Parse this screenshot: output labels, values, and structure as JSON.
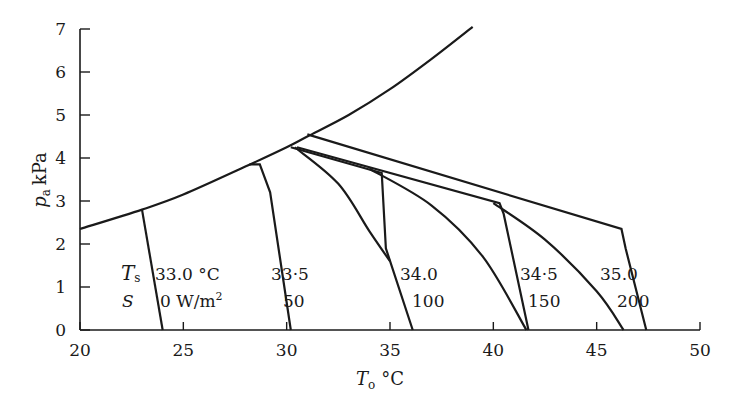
{
  "chart_data": {
    "type": "line",
    "title": "",
    "xlabel": "To °C",
    "ylabel": "pa kPa",
    "xlim": [
      20,
      50
    ],
    "ylim": [
      0,
      7
    ],
    "x_ticks": [
      "20",
      "25",
      "30",
      "35",
      "40",
      "45",
      "50"
    ],
    "y_ticks": [
      "0",
      "1",
      "2",
      "3",
      "4",
      "5",
      "6",
      "7"
    ],
    "grid": false,
    "legend": "none",
    "series": [
      {
        "name": "saturation vapour pressure curve",
        "x": [
          20,
          23,
          25,
          28,
          30,
          31,
          33,
          35,
          37,
          39
        ],
        "y": [
          2.35,
          2.8,
          3.15,
          3.8,
          4.25,
          4.5,
          5.0,
          5.6,
          6.3,
          7.05
        ]
      },
      {
        "name": "Ts 33.0 °C, S 0 W/m2",
        "x": [
          23.0,
          24.0
        ],
        "y": [
          2.8,
          0
        ]
      },
      {
        "name": "Ts 33.5 °C, S 50 W/m2",
        "x": [
          28.2,
          28.7,
          29.2,
          30.2
        ],
        "y": [
          3.85,
          3.85,
          3.2,
          0
        ]
      },
      {
        "name": "Ts 34.0 °C, S 100 W/m2",
        "x": [
          30.2,
          34.6,
          34.8,
          36.1
        ],
        "y": [
          4.25,
          3.65,
          1.9,
          0
        ]
      },
      {
        "name": "Ts 34.5 °C, S 150 W/m2",
        "x": [
          30.5,
          40.3,
          40.5,
          41.7
        ],
        "y": [
          4.25,
          2.95,
          2.7,
          0
        ]
      },
      {
        "name": "Ts 35.0 °C, S 200 W/m2",
        "x": [
          31.0,
          46.2,
          46.4,
          47.4
        ],
        "y": [
          4.55,
          2.35,
          1.9,
          0
        ]
      },
      {
        "name": "curve from 34.0 branch",
        "x": [
          30.4,
          32.5,
          34.0,
          35.0
        ],
        "y": [
          4.25,
          3.4,
          2.3,
          1.6
        ]
      },
      {
        "name": "curve from 34.5 branch",
        "x": [
          34.0,
          37.0,
          39.5,
          41.6
        ],
        "y": [
          3.75,
          2.9,
          1.7,
          0
        ]
      },
      {
        "name": "curve from 35.0 branch",
        "x": [
          40.0,
          42.5,
          45.0,
          46.3
        ],
        "y": [
          2.95,
          2.1,
          0.9,
          0
        ]
      }
    ],
    "annotations": [
      {
        "text": "Ts",
        "role": "row label"
      },
      {
        "text": "S",
        "role": "row label"
      },
      {
        "text": "33.0 °C",
        "role": "Ts value"
      },
      {
        "text": "0 W/m²",
        "role": "S value"
      },
      {
        "text": "33·5",
        "role": "Ts value"
      },
      {
        "text": "50",
        "role": "S value"
      },
      {
        "text": "34.0",
        "role": "Ts value"
      },
      {
        "text": "100",
        "role": "S value"
      },
      {
        "text": "34·5",
        "role": "Ts value"
      },
      {
        "text": "150",
        "role": "S value"
      },
      {
        "text": "35.0",
        "role": "Ts value"
      },
      {
        "text": "200",
        "role": "S value"
      }
    ]
  },
  "labels": {
    "ylabel_p": "p",
    "ylabel_sub": "a",
    "ylabel_unit": "kPa",
    "xlabel_T": "T",
    "xlabel_sub": "o",
    "xlabel_unit": "°C",
    "ts_T": "T",
    "ts_sub": "s",
    "s_label": "S",
    "ts_vals": [
      "33.0 °C",
      "33·5",
      "34.0",
      "34·5",
      "35.0"
    ],
    "s_vals": [
      "0 W/m",
      "50",
      "100",
      "150",
      "200"
    ],
    "s_unit_sup": "2"
  }
}
